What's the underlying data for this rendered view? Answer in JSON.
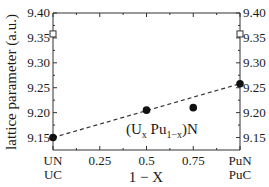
{
  "chart_data": {
    "type": "scatter",
    "title": "",
    "xlabel": "1 − X",
    "ylabel": "lattice parameter (a.u.)",
    "annotation": "(U_x Pu_{1-x})N",
    "xlim": [
      0,
      1
    ],
    "ylim": [
      9.125,
      9.4
    ],
    "x_ticks": [
      0,
      0.25,
      0.5,
      0.75,
      1
    ],
    "x_tick_labels": [
      [
        "UN",
        "UC"
      ],
      [
        "0.25"
      ],
      [
        "0.5"
      ],
      [
        "0.75"
      ],
      [
        "PuN",
        "PuC"
      ]
    ],
    "y_ticks": [
      9.15,
      9.2,
      9.25,
      9.3,
      9.35,
      9.4
    ],
    "y_tick_labels": [
      "9.15",
      "9.20",
      "9.25",
      "9.30",
      "9.35",
      "9.40"
    ],
    "right_axis_ticks": true,
    "grid": false,
    "series": [
      {
        "name": "(U,Pu)N",
        "marker": "filled-circle",
        "x": [
          0,
          0.5,
          0.75,
          1
        ],
        "y": [
          9.15,
          9.205,
          9.21,
          9.258
        ]
      },
      {
        "name": "carbide",
        "marker": "open-square",
        "x": [
          0,
          1
        ],
        "y": [
          9.358,
          9.358
        ]
      },
      {
        "name": "linear (Vegard) fit",
        "style": "dashed-line",
        "x": [
          0,
          1
        ],
        "y": [
          9.15,
          9.258
        ]
      }
    ]
  },
  "labels": {
    "ylabel": "lattice parameter (a.u.)",
    "xlabel": "1 − X",
    "annotation_prefix": "(U",
    "annotation_sub1": "x",
    "annotation_mid": " Pu",
    "annotation_sub2": "1−x",
    "annotation_suffix": ")N"
  },
  "colors": {
    "axis": "#333333",
    "marker": "#111111",
    "text": "#1a1a1a"
  }
}
